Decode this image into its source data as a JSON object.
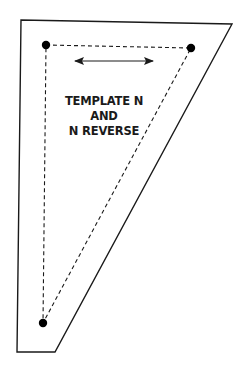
{
  "diagram": {
    "type": "quilt-template",
    "label_lines": [
      "TEMPLATE N",
      "AND",
      "N REVERSE"
    ],
    "colors": {
      "background": "#ffffff",
      "outline": "#1a1a1a",
      "dashed": "#1a1a1a",
      "dots": "#000000",
      "text": "#1a1a1a"
    },
    "outer_shape": {
      "points": [
        [
          21,
          20
        ],
        [
          232,
          24
        ],
        [
          55,
          352
        ],
        [
          17,
          352
        ]
      ]
    },
    "seam_triangle": {
      "points": [
        [
          46,
          45
        ],
        [
          191,
          48
        ],
        [
          43,
          323
        ]
      ]
    },
    "corner_dots": [
      {
        "x": 46,
        "y": 45
      },
      {
        "x": 191,
        "y": 48
      },
      {
        "x": 43,
        "y": 323
      }
    ],
    "grain_arrow": {
      "x1": 73,
      "y1": 61,
      "x2": 155,
      "y2": 61,
      "description": "double-headed grainline arrow"
    }
  }
}
